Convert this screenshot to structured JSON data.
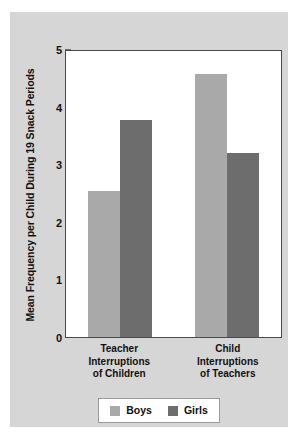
{
  "chart_data": {
    "type": "bar",
    "title": "",
    "xlabel": "",
    "ylabel": "Mean Frequency per Child During 19 Snack Periods",
    "ylim": [
      0,
      5
    ],
    "yticks": [
      0,
      1,
      2,
      3,
      4,
      5
    ],
    "ytick_labels": [
      "0",
      "1",
      "2",
      "3",
      "4",
      "5"
    ],
    "grid": false,
    "legend_position": "bottom-center",
    "categories": [
      "Teacher Interruptions of Children",
      "Child Interruptions of Teachers"
    ],
    "category_lines": [
      [
        "Teacher",
        "Interruptions",
        "of Children"
      ],
      [
        "Child",
        "Interruptions",
        "of Teachers"
      ]
    ],
    "series": [
      {
        "name": "Boys",
        "color": "#a9a9a9",
        "values": [
          2.55,
          4.6
        ]
      },
      {
        "name": "Girls",
        "color": "#6d6d6d",
        "values": [
          3.8,
          3.22
        ]
      }
    ]
  },
  "figure": {
    "background_color": "#d6d6d6",
    "plot_background_color": "#ffffff",
    "frame_color": "#4a4a4a",
    "text_color": "#111111"
  },
  "legend": {
    "entries": [
      {
        "label": "Boys",
        "color": "#a9a9a9"
      },
      {
        "label": "Girls",
        "color": "#6d6d6d"
      }
    ]
  }
}
